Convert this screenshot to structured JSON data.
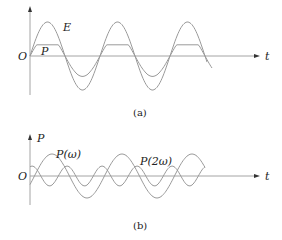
{
  "panels": [
    {
      "id": "a",
      "caption": "(a)",
      "origin_label": "O",
      "x_axis_label": "t",
      "y_axis_label": "",
      "curves": [
        {
          "name": "E",
          "label": "E",
          "shape": "sinusoid",
          "relative_amplitude": 1.0,
          "relative_frequency": 1
        },
        {
          "name": "P",
          "label": "P",
          "shape": "saturated sinusoid (clipped peaks)",
          "relative_amplitude": 0.5,
          "relative_frequency": 1
        }
      ]
    },
    {
      "id": "b",
      "caption": "(b)",
      "origin_label": "O",
      "x_axis_label": "t",
      "y_axis_label": "P",
      "curves": [
        {
          "name": "P-omega",
          "label": "P(ω)",
          "shape": "sinusoid",
          "relative_amplitude": 1.0,
          "relative_frequency": 1
        },
        {
          "name": "P-2omega",
          "label": "P(2ω)",
          "shape": "sinusoid",
          "relative_amplitude": 0.45,
          "relative_frequency": 2
        }
      ]
    }
  ]
}
